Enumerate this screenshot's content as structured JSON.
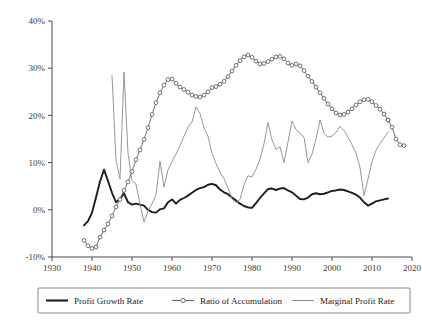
{
  "chart_data": {
    "type": "line",
    "title": "",
    "subtitle": "",
    "xlabel": "",
    "ylabel": "",
    "xlim": [
      1930,
      2020
    ],
    "ylim": [
      -10,
      40
    ],
    "grid": false,
    "legend_position": "bottom",
    "x_ticks": [
      "1930",
      "1940",
      "1950",
      "1960",
      "1970",
      "1980",
      "1990",
      "2000",
      "2010",
      "2020"
    ],
    "y_ticks": [
      "-10%",
      "0%",
      "10%",
      "20%",
      "30%",
      "40%"
    ],
    "y_tick_values": [
      -10,
      0,
      10,
      20,
      30,
      40
    ],
    "x_tick_values": [
      1930,
      1940,
      1950,
      1960,
      1970,
      1980,
      1990,
      2000,
      2010,
      2020
    ],
    "series": [
      {
        "name": "Profit Growth Rate",
        "style": "thick-solid-black",
        "color": "#1c1c1c",
        "markers": false,
        "x": [
          1938,
          1939,
          1940,
          1941,
          1942,
          1943,
          1944,
          1945,
          1946,
          1947,
          1948,
          1949,
          1950,
          1951,
          1952,
          1953,
          1954,
          1955,
          1956,
          1957,
          1958,
          1959,
          1960,
          1961,
          1962,
          1963,
          1964,
          1965,
          1966,
          1967,
          1968,
          1969,
          1970,
          1971,
          1972,
          1973,
          1974,
          1975,
          1976,
          1977,
          1978,
          1979,
          1980,
          1981,
          1982,
          1983,
          1984,
          1985,
          1986,
          1987,
          1988,
          1989,
          1990,
          1991,
          1992,
          1993,
          1994,
          1995,
          1996,
          1997,
          1998,
          1999,
          2000,
          2001,
          2002,
          2003,
          2004,
          2005,
          2006,
          2007,
          2008,
          2009,
          2010,
          2011,
          2012,
          2013,
          2014
        ],
        "y": [
          -3.3,
          -2.4,
          -0.6,
          2.6,
          6.0,
          8.5,
          6.1,
          3.6,
          1.6,
          2.3,
          3.5,
          1.6,
          1.1,
          1.3,
          1.1,
          0.9,
          0.0,
          -0.5,
          -0.6,
          0.1,
          0.3,
          1.6,
          2.2,
          1.3,
          2.1,
          2.5,
          3.0,
          3.6,
          4.2,
          4.6,
          4.8,
          5.3,
          5.5,
          5.2,
          4.3,
          3.7,
          3.3,
          2.6,
          2.0,
          1.3,
          0.8,
          0.5,
          0.4,
          1.4,
          2.5,
          3.5,
          4.4,
          4.5,
          4.2,
          4.5,
          4.6,
          4.1,
          3.7,
          3.0,
          2.3,
          2.2,
          2.6,
          3.3,
          3.5,
          3.3,
          3.4,
          3.7,
          4.0,
          4.1,
          4.3,
          4.2,
          3.9,
          3.6,
          3.2,
          2.6,
          1.6,
          0.9,
          1.3,
          1.8,
          2.0,
          2.2,
          2.4
        ]
      },
      {
        "name": "Ratio of Accumulation",
        "style": "thin-solid-with-circle-markers",
        "color": "#5f5f5f",
        "markers": true,
        "x": [
          1938,
          1939,
          1940,
          1941,
          1942,
          1943,
          1944,
          1945,
          1946,
          1947,
          1948,
          1949,
          1950,
          1951,
          1952,
          1953,
          1954,
          1955,
          1956,
          1957,
          1958,
          1959,
          1960,
          1961,
          1962,
          1963,
          1964,
          1965,
          1966,
          1967,
          1968,
          1969,
          1970,
          1971,
          1972,
          1973,
          1974,
          1975,
          1976,
          1977,
          1978,
          1979,
          1980,
          1981,
          1982,
          1983,
          1984,
          1985,
          1986,
          1987,
          1988,
          1989,
          1990,
          1991,
          1992,
          1993,
          1994,
          1995,
          1996,
          1997,
          1998,
          1999,
          2000,
          2001,
          2002,
          2003,
          2004,
          2005,
          2006,
          2007,
          2008,
          2009,
          2010,
          2011,
          2012,
          2013,
          2014
        ],
        "y": [
          -6.5,
          -7.6,
          -8.2,
          -7.9,
          -5.8,
          -4.3,
          -3.0,
          -1.3,
          0.6,
          2.2,
          4.1,
          5.9,
          8.1,
          10.6,
          12.7,
          14.9,
          17.4,
          20.2,
          22.7,
          24.8,
          26.4,
          27.6,
          27.7,
          26.8,
          26.0,
          25.5,
          24.9,
          24.3,
          24.0,
          23.9,
          24.3,
          25.0,
          25.9,
          26.1,
          26.6,
          27.2,
          28.2,
          29.4,
          30.6,
          31.6,
          32.4,
          32.8,
          32.3,
          31.5,
          30.9,
          31.0,
          31.4,
          31.9,
          32.4,
          32.5,
          32.0,
          31.1,
          30.6,
          30.9,
          30.5,
          29.5,
          28.3,
          27.2,
          26.0,
          24.8,
          23.6,
          22.4,
          21.4,
          20.5,
          20.1,
          20.2,
          20.7,
          21.4,
          22.2,
          22.9,
          23.3,
          23.4,
          22.9,
          22.1,
          21.3,
          20.3,
          19.0
        ]
      },
      {
        "name": "Ratio of Accumulation (tail)",
        "style": "thin-solid-with-circle-markers",
        "color": "#5f5f5f",
        "markers": true,
        "x": [
          2014,
          2015,
          2016,
          2017,
          2018
        ],
        "y": [
          19.0,
          17.5,
          15.0,
          13.8,
          13.6
        ],
        "note": "continuation of Ratio of Accumulation to the final flat point near 13%"
      },
      {
        "name": "Marginal Profit Rate",
        "style": "thin-solid-gray",
        "color": "#8a8a8a",
        "markers": false,
        "x": [
          1945,
          1946,
          1947,
          1948,
          1949,
          1950,
          1951,
          1952,
          1953,
          1954,
          1955,
          1956,
          1957,
          1958,
          1959,
          1960,
          1961,
          1962,
          1963,
          1964,
          1965,
          1966,
          1967,
          1968,
          1969,
          1970,
          1971,
          1972,
          1973,
          1974,
          1975,
          1976,
          1977,
          1978,
          1979,
          1980,
          1981,
          1982,
          1983,
          1984,
          1985,
          1986,
          1987,
          1988,
          1989,
          1990,
          1991,
          1992,
          1993,
          1994,
          1995,
          1996,
          1997,
          1998,
          1999,
          2000,
          2001,
          2002,
          2003,
          2004,
          2005,
          2006,
          2007,
          2008,
          2009,
          2010,
          2011,
          2012,
          2013,
          2014
        ],
        "y": [
          28.5,
          10.5,
          6.5,
          29.2,
          12.0,
          6.2,
          5.4,
          1.2,
          -2.6,
          -0.3,
          1.3,
          3.2,
          10.3,
          4.8,
          8.5,
          10.2,
          11.8,
          13.6,
          15.6,
          17.5,
          18.6,
          21.8,
          20.4,
          17.3,
          15.6,
          12.0,
          9.8,
          8.0,
          6.6,
          4.6,
          2.3,
          1.5,
          2.2,
          5.3,
          7.2,
          7.0,
          8.6,
          10.7,
          14.0,
          18.5,
          14.8,
          12.8,
          13.4,
          10.0,
          14.4,
          18.8,
          17.0,
          16.2,
          15.4,
          10.0,
          11.8,
          15.0,
          19.0,
          16.2,
          15.4,
          15.6,
          16.4,
          17.7,
          16.8,
          15.4,
          13.8,
          12.0,
          9.0,
          3.0,
          6.5,
          10.2,
          12.6,
          14.0,
          15.2,
          16.5
        ]
      }
    ]
  },
  "legend": {
    "items": [
      {
        "label": "Profit Growth Rate",
        "marker": "none",
        "swatch": "thick-line"
      },
      {
        "label": "Ratio of Accumulation",
        "marker": "circle",
        "swatch": "marker-line"
      },
      {
        "label": "Marginal Profit Rate",
        "marker": "none",
        "swatch": "thin-line"
      }
    ]
  }
}
